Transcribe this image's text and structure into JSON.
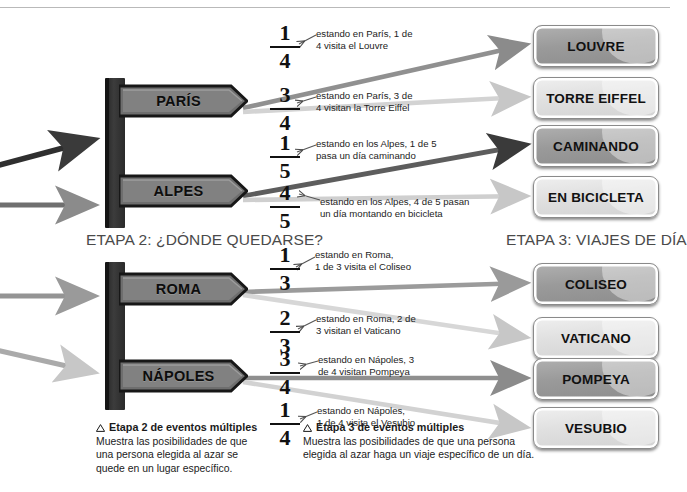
{
  "page": {
    "top_rule": true,
    "background": "#ffffff"
  },
  "headings": {
    "stage2": "ETAPA 2: ¿DÓNDE QUEDARSE?",
    "stage3": "ETAPA 3: VIAJES DE DÍA"
  },
  "signposts": [
    {
      "id": "signpost-france",
      "planks": [
        {
          "label": "PARÍS",
          "tone": "dark"
        },
        {
          "label": "ALPES",
          "tone": "dark"
        }
      ]
    },
    {
      "id": "signpost-italy",
      "planks": [
        {
          "label": "ROMA",
          "tone": "dark"
        },
        {
          "label": "NÁPOLES",
          "tone": "dark"
        }
      ]
    }
  ],
  "branches": [
    {
      "id": "branch-louvre",
      "fraction": {
        "numerator": "1",
        "denominator": "4"
      },
      "callout": "estando en París, 1 de\n4 visita el Louvre",
      "destination": "LOUVRE",
      "destination_tone": "dark"
    },
    {
      "id": "branch-torre-eiffel",
      "fraction": {
        "numerator": "3",
        "denominator": "4"
      },
      "callout": "estando en París, 3 de\n4 visitan la Torre Eiffel",
      "destination": "TORRE EIFFEL",
      "destination_tone": "light"
    },
    {
      "id": "branch-caminando",
      "fraction": {
        "numerator": "1",
        "denominator": "5"
      },
      "callout": "estando en los Alpes, 1 de 5\npasa un día caminando",
      "destination": "CAMINANDO",
      "destination_tone": "dark"
    },
    {
      "id": "branch-en-bicicleta",
      "fraction": {
        "numerator": "4",
        "denominator": "5"
      },
      "callout": "estando en los Alpes, 4 de 5 pasan\nun día montando en bicicleta",
      "destination": "EN BICICLETA",
      "destination_tone": "light"
    },
    {
      "id": "branch-coliseo",
      "fraction": {
        "numerator": "1",
        "denominator": "3"
      },
      "callout": "estando en Roma,\n1 de 3 visita el Coliseo",
      "destination": "COLISEO",
      "destination_tone": "dark"
    },
    {
      "id": "branch-vaticano",
      "fraction": {
        "numerator": "2",
        "denominator": "3"
      },
      "callout": "estando en Roma, 2 de\n3 visitan el Vaticano",
      "destination": "VATICANO",
      "destination_tone": "light"
    },
    {
      "id": "branch-pompeya",
      "fraction": {
        "numerator": "3",
        "denominator": "4"
      },
      "callout": "estando en Nápoles, 3\nde 4 visitan Pompeya",
      "destination": "POMPEYA",
      "destination_tone": "dark"
    },
    {
      "id": "branch-vesubio",
      "fraction": {
        "numerator": "1",
        "denominator": "4"
      },
      "callout": "estando en Nápoles,\n1 de 4 visita el Vesubio",
      "destination": "VESUBIO",
      "destination_tone": "light"
    }
  ],
  "legends": [
    {
      "id": "legend-stage2",
      "icon": "triangle-outline-icon",
      "title": "Etapa 2 de eventos múltiples",
      "body": "Muestra las posibilidades de que\nuna persona elegida al azar se\nquede en un lugar específico."
    },
    {
      "id": "legend-stage3",
      "icon": "triangle-outline-icon",
      "title": "Etapa 3 de eventos múltiples",
      "body": "Muestra las posibilidades de que una persona\nelegida al azar haga un viaje específico de un día."
    }
  ],
  "colors": {
    "arrow_dark": "#3a3a3a",
    "arrow_mid": "#808080",
    "arrow_light": "#c9c9c9",
    "post_dark": "#2d2d2d",
    "plank_gray": "#7c7c7c",
    "rule": "#b9b9b9"
  }
}
